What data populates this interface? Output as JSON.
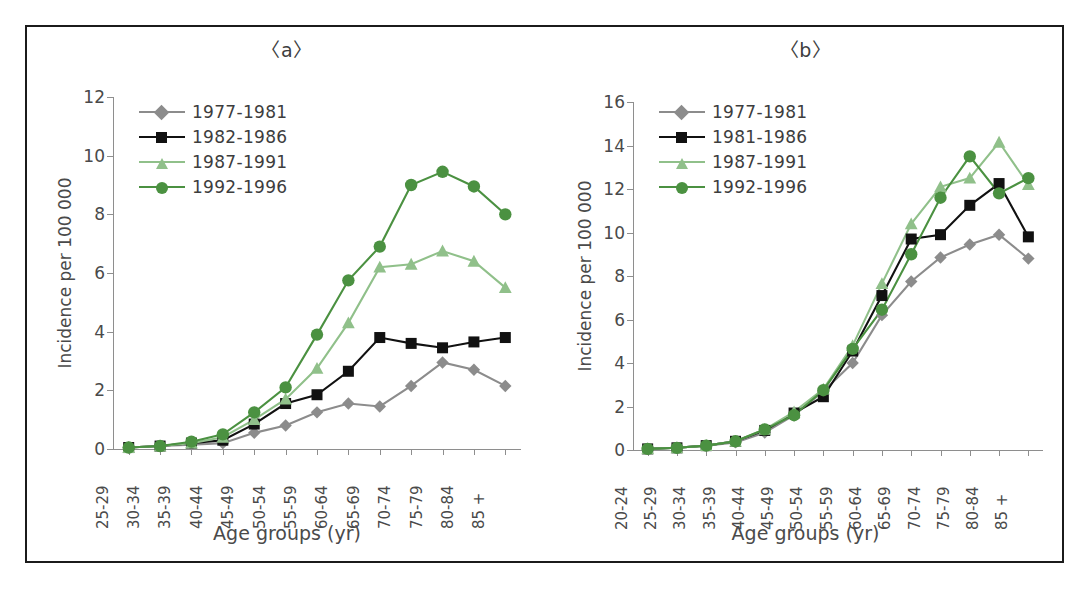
{
  "figure": {
    "ylabel": "Incidence per 100 000",
    "xlabel": "Age groups  (yr)"
  },
  "panels": [
    {
      "key": "a",
      "title": "〈a〉",
      "ylabel": "Incidence per 100 000",
      "xlabel": "Age groups  (yr)"
    },
    {
      "key": "b",
      "title": "〈b〉",
      "ylabel": "Incidence per 100 000",
      "xlabel": "Age groups  (yr)"
    }
  ],
  "colors": {
    "series_1977_1981": "#8c8c8c",
    "series_1982_1986": "#111111",
    "series_1987_1991": "#90c08a",
    "series_1992_1996": "#4b9141",
    "axis": "#8e8e8e",
    "frame": "#1b1b1b",
    "text": "#3d3d3d",
    "background": "#ffffff"
  },
  "chart_data": [
    {
      "type": "line",
      "panel": "a",
      "title": "〈a〉",
      "xlabel": "Age groups  (yr)",
      "ylabel": "Incidence per 100 000",
      "ylim": [
        0,
        12
      ],
      "yticks": [
        0,
        2,
        4,
        6,
        8,
        10,
        12
      ],
      "grid": false,
      "legend_position": "top-left",
      "categories": [
        "25-29",
        "30-34",
        "35-39",
        "40-44",
        "45-49",
        "50-54",
        "55-59",
        "60-64",
        "65-69",
        "70-74",
        "75-79",
        "80-84",
        "85 +"
      ],
      "series": [
        {
          "name": "1977-1981",
          "marker": "diamond",
          "color": "#8c8c8c",
          "values": [
            0.05,
            0.1,
            0.15,
            0.2,
            0.55,
            0.8,
            1.25,
            1.55,
            1.45,
            2.15,
            2.95,
            2.7,
            2.15
          ]
        },
        {
          "name": "1982-1986",
          "marker": "square",
          "color": "#111111",
          "values": [
            0.05,
            0.1,
            0.2,
            0.3,
            0.85,
            1.55,
            1.85,
            2.65,
            3.8,
            3.6,
            3.45,
            3.65,
            3.8
          ]
        },
        {
          "name": "1987-1991",
          "marker": "triangle",
          "color": "#90c08a",
          "values": [
            0.05,
            0.1,
            0.2,
            0.4,
            1.0,
            1.7,
            2.75,
            4.3,
            6.2,
            6.3,
            6.75,
            6.4,
            5.5
          ]
        },
        {
          "name": "1992-1996",
          "marker": "circle",
          "color": "#4b9141",
          "values": [
            0.05,
            0.1,
            0.25,
            0.5,
            1.25,
            2.1,
            3.9,
            5.75,
            6.9,
            9.0,
            9.45,
            8.95,
            8.0
          ]
        }
      ]
    },
    {
      "type": "line",
      "panel": "b",
      "title": "〈b〉",
      "xlabel": "Age groups  (yr)",
      "ylabel": "Incidence per 100 000",
      "ylim": [
        0,
        16
      ],
      "yticks": [
        0,
        2,
        4,
        6,
        8,
        10,
        12,
        14,
        16
      ],
      "grid": false,
      "legend_position": "top-left",
      "categories": [
        "20-24",
        "25-29",
        "30-34",
        "35-39",
        "40-44",
        "45-49",
        "50-54",
        "55-59",
        "60-64",
        "65-69",
        "70-74",
        "75-79",
        "80-84",
        "85 +"
      ],
      "series": [
        {
          "name": "1977-1981",
          "marker": "diamond",
          "color": "#8c8c8c",
          "values": [
            0.05,
            0.1,
            0.2,
            0.35,
            0.8,
            1.6,
            2.7,
            4.0,
            6.2,
            7.75,
            8.85,
            9.45,
            9.9,
            8.8
          ]
        },
        {
          "name": "1981-1986",
          "marker": "square",
          "color": "#111111",
          "values": [
            0.05,
            0.1,
            0.2,
            0.4,
            0.9,
            1.7,
            2.45,
            4.55,
            7.1,
            9.7,
            9.9,
            11.25,
            12.25,
            9.8
          ]
        },
        {
          "name": "1987-1991",
          "marker": "triangle",
          "color": "#90c08a",
          "values": [
            0.05,
            0.1,
            0.2,
            0.4,
            0.95,
            1.75,
            2.8,
            4.8,
            7.65,
            10.4,
            12.1,
            12.5,
            14.15,
            12.2
          ]
        },
        {
          "name": "1992-1996",
          "marker": "circle",
          "color": "#4b9141",
          "values": [
            0.05,
            0.1,
            0.2,
            0.4,
            0.95,
            1.6,
            2.75,
            4.65,
            6.45,
            9.0,
            11.6,
            13.5,
            11.8,
            12.5
          ]
        }
      ]
    }
  ]
}
